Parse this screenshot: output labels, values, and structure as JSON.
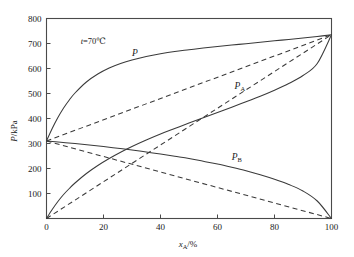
{
  "chart_data": {
    "type": "line",
    "title": "",
    "xlabel": "x_A/%",
    "ylabel": "P/kPa",
    "xlabel_main": "x",
    "xlabel_sub": "A",
    "xlabel_unit": "/%",
    "ylabel_text": "P/kPa",
    "xlim": [
      0,
      100
    ],
    "ylim": [
      0,
      800
    ],
    "xticks": [
      0,
      20,
      40,
      60,
      80,
      100
    ],
    "yticks": [
      0,
      100,
      200,
      300,
      400,
      500,
      600,
      700,
      800
    ],
    "xtick_labels": [
      "0",
      "20",
      "40",
      "60",
      "80",
      "100"
    ],
    "ytick_labels": [
      "0",
      "100",
      "200",
      "300",
      "400",
      "500",
      "600",
      "700",
      "800"
    ],
    "grid": false,
    "legend": "none",
    "annotations": [
      {
        "name": "temperature",
        "text": "t=70℃",
        "x": 12,
        "y": 700
      }
    ],
    "curve_labels": [
      {
        "name": "P",
        "main": "P",
        "sub": "",
        "x": 30,
        "y": 650
      },
      {
        "name": "PA",
        "main": "P",
        "sub": "A",
        "x": 66,
        "y": 520
      },
      {
        "name": "PB",
        "main": "P",
        "sub": "B",
        "x": 65,
        "y": 235
      }
    ],
    "series": [
      {
        "name": "P total (real)",
        "label": "P",
        "style": "solid",
        "x": [
          0,
          2,
          4,
          6,
          8,
          10,
          14,
          18,
          22,
          26,
          30,
          35,
          40,
          45,
          50,
          55,
          60,
          65,
          70,
          75,
          80,
          85,
          90,
          95,
          100
        ],
        "y": [
          310,
          360,
          404,
          442,
          474,
          502,
          546,
          578,
          602,
          620,
          634,
          648,
          659,
          668,
          675,
          682,
          688,
          694,
          699,
          705,
          711,
          716,
          722,
          728,
          735
        ]
      },
      {
        "name": "P_A partial (real)",
        "label": "P_A",
        "style": "solid",
        "x": [
          0,
          2,
          4,
          6,
          8,
          10,
          14,
          18,
          22,
          26,
          30,
          35,
          40,
          45,
          50,
          55,
          60,
          65,
          70,
          75,
          80,
          85,
          90,
          95,
          100
        ],
        "y": [
          0,
          36,
          68,
          96,
          120,
          142,
          180,
          212,
          240,
          265,
          288,
          314,
          338,
          360,
          382,
          403,
          424,
          445,
          467,
          489,
          513,
          540,
          572,
          620,
          735
        ]
      },
      {
        "name": "P_B partial (real)",
        "label": "P_B",
        "style": "solid",
        "x": [
          0,
          5,
          10,
          15,
          20,
          25,
          30,
          35,
          40,
          45,
          50,
          55,
          60,
          65,
          70,
          75,
          80,
          85,
          90,
          95,
          100
        ],
        "y": [
          310,
          305,
          300,
          294,
          288,
          281,
          274,
          266,
          258,
          249,
          240,
          229,
          218,
          205,
          191,
          175,
          157,
          136,
          110,
          70,
          0
        ]
      },
      {
        "name": "P total ideal (Raoult)",
        "label": "",
        "style": "dashed",
        "x": [
          0,
          100
        ],
        "y": [
          310,
          735
        ]
      },
      {
        "name": "P_A ideal (Raoult)",
        "label": "",
        "style": "dashed",
        "x": [
          0,
          100
        ],
        "y": [
          0,
          735
        ]
      },
      {
        "name": "P_B ideal (Raoult)",
        "label": "",
        "style": "dashed",
        "x": [
          0,
          100
        ],
        "y": [
          310,
          0
        ]
      }
    ]
  }
}
